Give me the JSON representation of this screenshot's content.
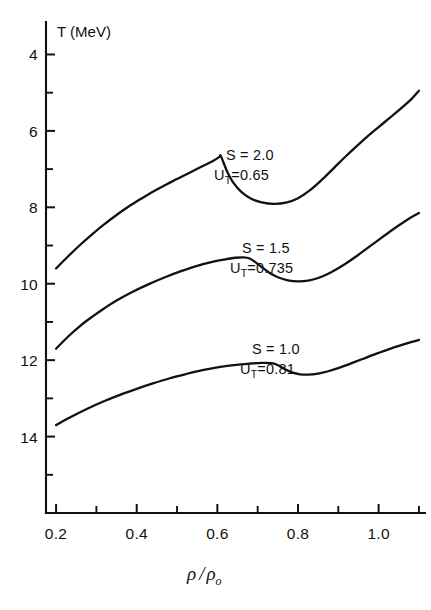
{
  "figure": {
    "background_color": "#ffffff",
    "ink_color": "#111111"
  },
  "axes": {
    "y_title": "T (MeV)",
    "x_title_numerator": "ρ",
    "x_title_slash": "/",
    "x_title_denominator": "ρ",
    "x_title_denominator_sub": "o",
    "y_ticks": [
      "14",
      "12",
      "10",
      "8",
      "6",
      "4"
    ],
    "x_ticks": [
      "0.2",
      "0.4",
      "0.6",
      "0.8",
      "1.0"
    ]
  },
  "annotations": [
    {
      "entropy_label": "S = 2.0",
      "u_label_base": "U",
      "u_label_sub": "T",
      "u_label_value": "=0.65",
      "x": 226,
      "y": 160
    },
    {
      "entropy_label": "S = 1.5",
      "u_label_base": "U",
      "u_label_sub": "T",
      "u_label_value": "=0.735",
      "x": 242,
      "y": 253
    },
    {
      "entropy_label": "S = 1.0",
      "u_label_base": "U",
      "u_label_sub": "T",
      "u_label_value": "=0.81",
      "x": 252,
      "y": 354
    }
  ],
  "chart_data": {
    "type": "line",
    "title": "",
    "xlabel": "ρ/ρ₀",
    "ylabel": "T (MeV)",
    "xlim": [
      0.175,
      1.115
    ],
    "ylim": [
      2.0,
      14.85
    ],
    "grid": false,
    "legend": "inline-annotations",
    "xticks": [
      0.2,
      0.4,
      0.6,
      0.8,
      1.0
    ],
    "yticks": [
      4,
      6,
      8,
      10,
      12,
      14
    ],
    "xminorticks": [
      0.3,
      0.5,
      0.7,
      0.9,
      1.1
    ],
    "yminorticks": [
      3,
      5,
      7,
      9,
      11,
      13
    ],
    "series": [
      {
        "name": "S = 2.0, U_T = 0.65",
        "x": [
          0.2,
          0.23,
          0.26,
          0.29,
          0.32,
          0.35,
          0.38,
          0.41,
          0.44,
          0.47,
          0.5,
          0.53,
          0.56,
          0.59,
          0.605,
          0.608,
          0.615,
          0.625,
          0.64,
          0.66,
          0.685,
          0.71,
          0.74,
          0.77,
          0.8,
          0.83,
          0.86,
          0.89,
          0.92,
          0.96,
          1.0,
          1.04,
          1.08,
          1.1
        ],
        "y": [
          8.4,
          8.72,
          9.02,
          9.3,
          9.56,
          9.8,
          10.02,
          10.22,
          10.41,
          10.58,
          10.74,
          10.9,
          11.06,
          11.22,
          11.32,
          11.36,
          11.18,
          10.92,
          10.64,
          10.4,
          10.22,
          10.13,
          10.09,
          10.12,
          10.24,
          10.45,
          10.73,
          11.04,
          11.35,
          11.74,
          12.1,
          12.45,
          12.82,
          13.05
        ]
      },
      {
        "name": "S = 1.5, U_T = 0.735",
        "x": [
          0.2,
          0.23,
          0.26,
          0.29,
          0.32,
          0.35,
          0.39,
          0.43,
          0.47,
          0.51,
          0.55,
          0.59,
          0.62,
          0.645,
          0.665,
          0.68,
          0.695,
          0.712,
          0.73,
          0.75,
          0.775,
          0.8,
          0.825,
          0.85,
          0.88,
          0.91,
          0.95,
          0.99,
          1.03,
          1.07,
          1.1
        ],
        "y": [
          6.3,
          6.62,
          6.9,
          7.14,
          7.36,
          7.56,
          7.79,
          7.99,
          8.17,
          8.33,
          8.47,
          8.58,
          8.64,
          8.68,
          8.69,
          8.66,
          8.56,
          8.42,
          8.28,
          8.17,
          8.09,
          8.06,
          8.08,
          8.15,
          8.29,
          8.47,
          8.76,
          9.07,
          9.38,
          9.67,
          9.85
        ]
      },
      {
        "name": "S = 1.0, U_T = 0.81",
        "x": [
          0.2,
          0.24,
          0.28,
          0.32,
          0.36,
          0.4,
          0.44,
          0.48,
          0.52,
          0.56,
          0.6,
          0.64,
          0.68,
          0.71,
          0.735,
          0.752,
          0.768,
          0.785,
          0.805,
          0.825,
          0.85,
          0.875,
          0.9,
          0.93,
          0.96,
          1.0,
          1.04,
          1.08,
          1.1
        ],
        "y": [
          4.3,
          4.53,
          4.74,
          4.93,
          5.1,
          5.25,
          5.39,
          5.52,
          5.63,
          5.73,
          5.81,
          5.87,
          5.91,
          5.93,
          5.92,
          5.86,
          5.76,
          5.68,
          5.63,
          5.62,
          5.65,
          5.71,
          5.79,
          5.91,
          6.03,
          6.19,
          6.34,
          6.47,
          6.53
        ]
      }
    ]
  }
}
